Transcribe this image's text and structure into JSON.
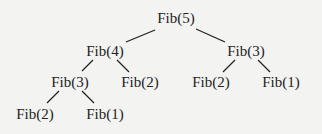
{
  "diagram": {
    "title": "",
    "nodes": [
      {
        "id": "n0",
        "label": "Fib(5)",
        "x": 176,
        "y": 18
      },
      {
        "id": "n1",
        "label": "Fib(4)",
        "x": 105,
        "y": 51
      },
      {
        "id": "n2",
        "label": "Fib(3)",
        "x": 246,
        "y": 51
      },
      {
        "id": "n3",
        "label": "Fib(3)",
        "x": 70,
        "y": 82
      },
      {
        "id": "n4",
        "label": "Fib(2)",
        "x": 140,
        "y": 82
      },
      {
        "id": "n5",
        "label": "Fib(2)",
        "x": 211,
        "y": 82
      },
      {
        "id": "n6",
        "label": "Fib(1)",
        "x": 281,
        "y": 82
      },
      {
        "id": "n7",
        "label": "Fib(2)",
        "x": 35,
        "y": 114
      },
      {
        "id": "n8",
        "label": "Fib(1)",
        "x": 105,
        "y": 114
      }
    ],
    "edges": [
      {
        "from": "n0",
        "to": "n1"
      },
      {
        "from": "n0",
        "to": "n2"
      },
      {
        "from": "n1",
        "to": "n3"
      },
      {
        "from": "n1",
        "to": "n4"
      },
      {
        "from": "n2",
        "to": "n5"
      },
      {
        "from": "n2",
        "to": "n6"
      },
      {
        "from": "n3",
        "to": "n7"
      },
      {
        "from": "n3",
        "to": "n8"
      }
    ]
  }
}
